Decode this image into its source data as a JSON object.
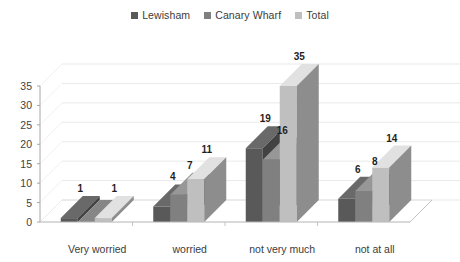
{
  "chart_data": {
    "type": "bar",
    "title": "",
    "subtitle": "",
    "xlabel": "",
    "ylabel": "",
    "ylim": [
      0,
      35
    ],
    "yticks": [
      "0",
      "5",
      "10",
      "15",
      "20",
      "25",
      "30",
      "35"
    ],
    "grid": true,
    "legend_position": "top-center",
    "three_d": true,
    "categories": [
      "Very worried",
      "worried",
      "not very much",
      "not at all"
    ],
    "series": [
      {
        "name": "Lewisham",
        "color": "#595959",
        "values": [
          1,
          4,
          19,
          6
        ]
      },
      {
        "name": "Canary Wharf",
        "color": "#808080",
        "values": [
          0,
          7,
          16,
          8
        ]
      },
      {
        "name": "Total",
        "color": "#bfbfbf",
        "values": [
          1,
          11,
          35,
          14
        ]
      }
    ],
    "data_labels": [
      [
        "1",
        "",
        "1"
      ],
      [
        "4",
        "7",
        "11"
      ],
      [
        "19",
        "16",
        "35"
      ],
      [
        "6",
        "8",
        "14"
      ]
    ]
  },
  "legend": {
    "entries": [
      {
        "label": "Lewisham"
      },
      {
        "label": "Canary Wharf"
      },
      {
        "label": "Total"
      }
    ]
  },
  "axes": {
    "y_ticks": [
      "35",
      "30",
      "25",
      "20",
      "15",
      "10",
      "5",
      "0"
    ],
    "x_categories": [
      "Very worried",
      "worried",
      "not very much",
      "not at all"
    ]
  }
}
